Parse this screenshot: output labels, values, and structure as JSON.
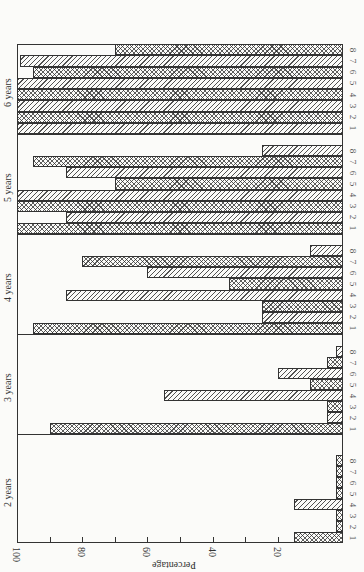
{
  "chart_data": {
    "type": "bar",
    "orientation": "rotated-90-clockwise (horizontal bars in image)",
    "title": "",
    "xlabel": "",
    "ylabel": "Percentage",
    "ylim": [
      0,
      100
    ],
    "yticks": [
      20,
      40,
      60,
      80,
      100
    ],
    "minor_ticks": [
      30,
      50,
      70,
      90
    ],
    "categories": [
      "1",
      "2",
      "3",
      "4",
      "5",
      "6",
      "7",
      "8"
    ],
    "groups": [
      {
        "name": "2 years",
        "values": [
          15,
          2,
          2,
          15,
          2,
          2,
          2,
          2
        ],
        "patterns": [
          "cross",
          "cross",
          "cross",
          "diag",
          "cross",
          "cross",
          "cross",
          "cross"
        ]
      },
      {
        "name": "3 years",
        "values": [
          90,
          5,
          5,
          55,
          10,
          20,
          5,
          2
        ],
        "patterns": [
          "cross",
          "diag",
          "cross",
          "diag",
          "cross",
          "diag",
          "cross",
          "diag"
        ]
      },
      {
        "name": "4 years",
        "values": [
          95,
          25,
          25,
          85,
          35,
          60,
          80,
          10
        ],
        "patterns": [
          "cross",
          "diag",
          "cross",
          "diag",
          "cross",
          "diag",
          "cross",
          "diag"
        ]
      },
      {
        "name": "5 years",
        "values": [
          100,
          85,
          100,
          100,
          70,
          85,
          95,
          25
        ],
        "patterns": [
          "cross",
          "diag",
          "cross",
          "diag",
          "cross",
          "diag",
          "cross",
          "diag"
        ]
      },
      {
        "name": "6 years",
        "values": [
          100,
          100,
          100,
          100,
          100,
          95,
          99,
          70
        ],
        "patterns": [
          "diag",
          "cross",
          "diag",
          "cross",
          "diag",
          "cross",
          "diag",
          "cross"
        ]
      }
    ],
    "legend": null,
    "grid": false
  },
  "axis": {
    "title": "Percentage",
    "tick_labels": [
      "100",
      "80",
      "60",
      "40",
      "20"
    ]
  }
}
